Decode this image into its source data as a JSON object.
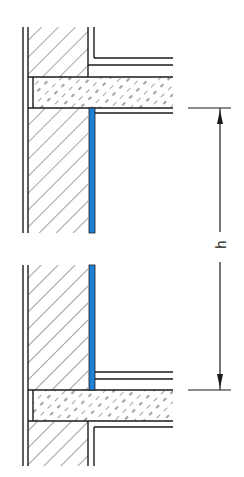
{
  "diagram": {
    "type": "section-detail",
    "dimension": {
      "label": "h"
    },
    "colors": {
      "line": "#1a1a1a",
      "membrane": "#1e7fd6"
    }
  }
}
